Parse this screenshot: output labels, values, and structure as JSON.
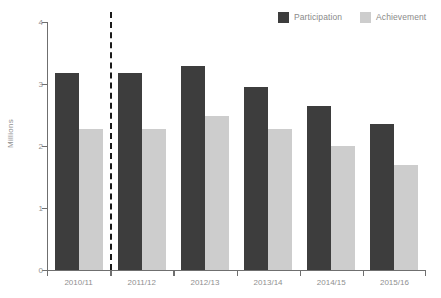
{
  "legend": {
    "position": "top-right",
    "entries": [
      {
        "label": "Participation",
        "color": "#3d3d3d",
        "swatch_name": "participation-swatch"
      },
      {
        "label": "Achievement",
        "color": "#cdcdcd",
        "swatch_name": "achievement-swatch"
      }
    ]
  },
  "axes": {
    "ylabel": "Millions",
    "xlabel": "",
    "y_ticks": [
      "0",
      "1",
      "2",
      "3",
      "4"
    ]
  },
  "annotations": {
    "divider": {
      "after_category": "2010/11",
      "style": "dashed-vertical"
    }
  },
  "chart_data": {
    "type": "bar",
    "title": "",
    "subtitle": "",
    "xlabel": "",
    "ylabel": "Millions",
    "ylim": [
      0,
      4
    ],
    "ytick_values": [
      0,
      1,
      2,
      3,
      4
    ],
    "grid": false,
    "legend_position": "top-right",
    "categories": [
      "2010/11",
      "2011/12",
      "2012/13",
      "2013/14",
      "2014/15",
      "2015/16"
    ],
    "series": [
      {
        "name": "Participation",
        "color": "#3d3d3d",
        "values": [
          3.17,
          3.17,
          3.29,
          2.95,
          2.64,
          2.36
        ]
      },
      {
        "name": "Achievement",
        "color": "#cdcdcd",
        "values": [
          2.28,
          2.28,
          2.48,
          2.28,
          2.0,
          1.7
        ]
      }
    ],
    "annotations": [
      {
        "type": "vline",
        "label": "",
        "after_category": "2010/11",
        "style": "dashed",
        "color": "#1a1a1a"
      }
    ]
  }
}
